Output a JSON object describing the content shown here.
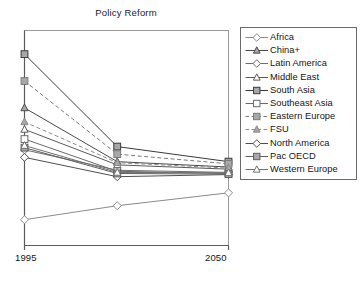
{
  "chart_data": {
    "type": "line",
    "title": "Policy Reform",
    "xlabel": "",
    "ylabel": "",
    "x": [
      1995,
      2020,
      2050
    ],
    "tick_labels": [
      "1995",
      "2050"
    ],
    "grid": false,
    "legend_position": "right",
    "axis_style": "left-and-bottom-spines-box",
    "ylim": [
      0,
      100
    ],
    "xlim": [
      1995,
      2050
    ],
    "series": [
      {
        "name": "Africa",
        "values": [
          12.0,
          18.5,
          24.5
        ],
        "marker": "diamond",
        "marker_fill": "hollow",
        "line_style": "solid",
        "color": "#8a8a8a"
      },
      {
        "name": "China+",
        "values": [
          64.0,
          39.0,
          36.5
        ],
        "marker": "triangle",
        "marker_fill": "filled",
        "line_style": "solid",
        "color": "#4a4a4a"
      },
      {
        "name": "Latin America",
        "values": [
          44.5,
          35.0,
          34.0
        ],
        "marker": "diamond",
        "marker_fill": "hollow",
        "line_style": "solid",
        "color": "#6e6e6e"
      },
      {
        "name": "Middle East",
        "values": [
          54.0,
          37.5,
          35.5
        ],
        "marker": "triangle",
        "marker_fill": "hollow",
        "line_style": "solid",
        "color": "#5a5a5a"
      },
      {
        "name": "South Asia",
        "values": [
          89.0,
          46.0,
          39.0
        ],
        "marker": "square",
        "marker_fill": "filled",
        "line_style": "solid",
        "color": "#3a3a3a"
      },
      {
        "name": "Southeast Asia",
        "values": [
          49.5,
          34.5,
          33.5
        ],
        "marker": "square",
        "marker_fill": "hollow",
        "line_style": "solid",
        "color": "#6a6a6a"
      },
      {
        "name": "Eastern Europe",
        "values": [
          76.5,
          42.5,
          38.0
        ],
        "marker": "square",
        "marker_fill": "filled",
        "line_style": "dashed",
        "color": "#7a7a7a"
      },
      {
        "name": "FSU",
        "values": [
          57.5,
          38.5,
          36.0
        ],
        "marker": "triangle",
        "marker_fill": "filled",
        "line_style": "dashed",
        "color": "#8a8a8a"
      },
      {
        "name": "North America",
        "values": [
          41.0,
          32.0,
          33.0
        ],
        "marker": "diamond",
        "marker_fill": "hollow",
        "line_style": "solid",
        "color": "#4f4f4f"
      },
      {
        "name": "Pac OECD",
        "values": [
          45.5,
          33.5,
          33.2
        ],
        "marker": "square",
        "marker_fill": "filled",
        "line_style": "solid",
        "color": "#5e5e5e"
      },
      {
        "name": "Western Europe",
        "values": [
          46.5,
          34.0,
          33.8
        ],
        "marker": "triangle",
        "marker_fill": "hollow",
        "line_style": "solid",
        "color": "#707070"
      }
    ]
  }
}
